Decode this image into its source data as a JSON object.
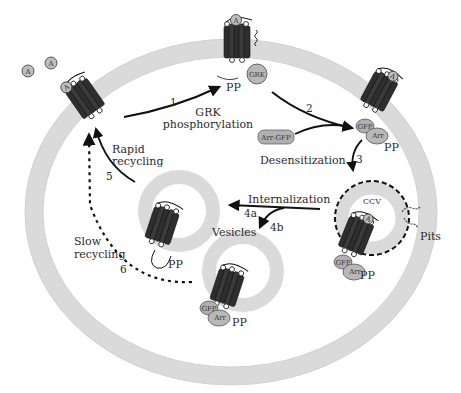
{
  "diagram": {
    "colors": {
      "membrane": "#dcdcdc",
      "membrane_edge": "#c8c8c8",
      "receptor": "#333333",
      "protein": "#b4b4b4",
      "arrow": "#111111",
      "text": "#2a2a2a"
    },
    "ligand_symbol": "A",
    "free_ligands": [
      "A",
      "A"
    ],
    "steps": [
      {
        "id": "1",
        "label": "1",
        "caption_line1": "GRK",
        "caption_line2": "phosphorylation"
      },
      {
        "id": "2",
        "label": "2",
        "caption": "Desensitization"
      },
      {
        "id": "3",
        "label": "3"
      },
      {
        "id": "4a",
        "label": "4a",
        "caption": "Internalization"
      },
      {
        "id": "4b",
        "label": "4b"
      },
      {
        "id": "5",
        "label": "5",
        "caption_line1": "Rapid",
        "caption_line2": "recycling"
      },
      {
        "id": "6",
        "label": "6",
        "caption_line1": "Slow",
        "caption_line2": "recycling"
      }
    ],
    "labels": {
      "grk": "GRK",
      "pp": "PP",
      "arr_gfp": "Arr-GFP",
      "gfp": "GFP",
      "arr": "Arr",
      "ccv": "CCV",
      "pits": "Pits",
      "vesicles": "Vesicles"
    }
  }
}
